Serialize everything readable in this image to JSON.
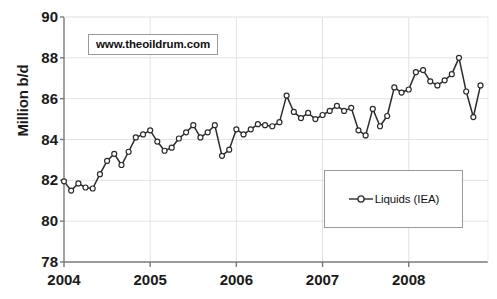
{
  "chart_data": {
    "type": "line",
    "title": "",
    "xlabel": "",
    "ylabel": "Million b/d",
    "ylim": [
      78,
      90
    ],
    "yticks": [
      90,
      88,
      86,
      84,
      82,
      80,
      78
    ],
    "xticks": [
      "2004",
      "2005",
      "2006",
      "2007",
      "2008"
    ],
    "xlim": [
      2004.0,
      2008.92
    ],
    "grid": true,
    "legend_position": "lower-right",
    "series": [
      {
        "name": "Liquids (IEA)",
        "marker": "open-circle",
        "color": "#2b2b2b",
        "x": [
          2004.0,
          2004.083,
          2004.167,
          2004.25,
          2004.333,
          2004.417,
          2004.5,
          2004.583,
          2004.667,
          2004.75,
          2004.833,
          2004.917,
          2005.0,
          2005.083,
          2005.167,
          2005.25,
          2005.333,
          2005.417,
          2005.5,
          2005.583,
          2005.667,
          2005.75,
          2005.833,
          2005.917,
          2006.0,
          2006.083,
          2006.167,
          2006.25,
          2006.333,
          2006.417,
          2006.5,
          2006.583,
          2006.667,
          2006.75,
          2006.833,
          2006.917,
          2007.0,
          2007.083,
          2007.167,
          2007.25,
          2007.333,
          2007.417,
          2007.5,
          2007.583,
          2007.667,
          2007.75,
          2007.833,
          2007.917,
          2008.0,
          2008.083,
          2008.167,
          2008.25,
          2008.333,
          2008.417,
          2008.5,
          2008.583,
          2008.667,
          2008.75,
          2008.833
        ],
        "values": [
          81.95,
          81.5,
          81.85,
          81.65,
          81.6,
          82.3,
          82.95,
          83.3,
          82.75,
          83.4,
          84.1,
          84.25,
          84.45,
          83.9,
          83.45,
          83.6,
          84.05,
          84.35,
          84.7,
          84.1,
          84.35,
          84.7,
          83.2,
          83.5,
          84.5,
          84.25,
          84.5,
          84.75,
          84.7,
          84.65,
          84.85,
          86.15,
          85.35,
          85.05,
          85.3,
          85.0,
          85.2,
          85.4,
          85.65,
          85.4,
          85.55,
          84.45,
          84.2,
          85.5,
          84.65,
          85.15,
          86.55,
          86.3,
          86.45,
          87.3,
          87.4,
          86.85,
          86.65,
          86.9,
          87.2,
          88.0,
          86.35,
          85.1,
          86.65
        ]
      }
    ],
    "annotations": [
      {
        "name": "watermark",
        "text": "www.theoildrum.com"
      }
    ]
  },
  "watermark": {
    "text": "www.theoildrum.com"
  },
  "legend": {
    "entries": [
      {
        "label": "Liquids (IEA)"
      }
    ]
  },
  "axes": {
    "y_label": "Million b/d",
    "y_ticks": [
      "90",
      "88",
      "86",
      "84",
      "82",
      "80",
      "78"
    ],
    "x_ticks": [
      "2004",
      "2005",
      "2006",
      "2007",
      "2008"
    ]
  }
}
